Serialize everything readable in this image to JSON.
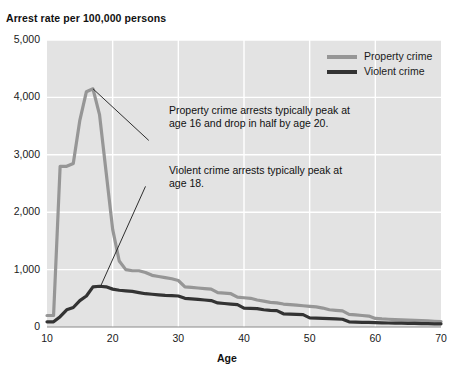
{
  "chart_data": {
    "type": "line",
    "title": "Arrest rate per 100,000 persons",
    "xlabel": "Age",
    "ylabel": "Arrest rate per 100,000 persons",
    "xlim": [
      10,
      70
    ],
    "ylim": [
      0,
      5000
    ],
    "grid": true,
    "legend_position": "top-right",
    "y_ticks": [
      "0",
      "1,000",
      "2,000",
      "3,000",
      "4,000",
      "5,000"
    ],
    "y_tick_values": [
      0,
      1000,
      2000,
      3000,
      4000,
      5000
    ],
    "x_ticks": [
      "10",
      "20",
      "30",
      "40",
      "50",
      "60",
      "70"
    ],
    "x_tick_values": [
      10,
      20,
      30,
      40,
      50,
      60,
      70
    ],
    "x": [
      10,
      11,
      12,
      13,
      14,
      15,
      16,
      17,
      18,
      19,
      20,
      21,
      22,
      23,
      24,
      25,
      26,
      27,
      28,
      29,
      30,
      31,
      32,
      33,
      34,
      35,
      36,
      37,
      38,
      39,
      40,
      41,
      42,
      43,
      44,
      45,
      46,
      47,
      48,
      49,
      50,
      51,
      52,
      53,
      54,
      55,
      56,
      57,
      58,
      59,
      60,
      61,
      62,
      63,
      64,
      65,
      66,
      67,
      68,
      69,
      70
    ],
    "series": [
      {
        "name": "Property crime",
        "color": "#969696",
        "values": [
          200,
          200,
          2800,
          2800,
          2850,
          3600,
          4100,
          4150,
          3700,
          2700,
          1700,
          1150,
          1000,
          980,
          980,
          950,
          900,
          880,
          860,
          840,
          810,
          700,
          690,
          680,
          670,
          660,
          600,
          590,
          580,
          520,
          510,
          500,
          470,
          450,
          430,
          420,
          400,
          390,
          380,
          370,
          360,
          350,
          330,
          300,
          290,
          280,
          220,
          210,
          200,
          190,
          150,
          140,
          135,
          130,
          125,
          120,
          115,
          110,
          105,
          100,
          95
        ]
      },
      {
        "name": "Violent crime",
        "color": "#333333",
        "values": [
          90,
          90,
          180,
          300,
          340,
          460,
          540,
          700,
          710,
          700,
          660,
          640,
          630,
          620,
          600,
          580,
          570,
          560,
          550,
          545,
          540,
          500,
          490,
          480,
          470,
          460,
          420,
          410,
          400,
          390,
          330,
          325,
          320,
          300,
          290,
          285,
          230,
          225,
          220,
          215,
          160,
          155,
          150,
          145,
          140,
          135,
          90,
          85,
          82,
          80,
          75,
          72,
          70,
          68,
          66,
          64,
          62,
          60,
          58,
          56,
          55
        ]
      }
    ],
    "annotations": [
      {
        "id": "property-annotation",
        "text": "Property crime arrests typically peak at\nage 16 and drop in half by age 20.",
        "leader_from_x": 17.0,
        "leader_from_y": 4150,
        "leader_to_x": 25.5,
        "leader_to_y": 3250
      },
      {
        "id": "violent-annotation",
        "text": "Violent crime arrests typically peak at\nage 18.",
        "leader_from_x": 18.2,
        "leader_from_y": 720,
        "leader_to_x": 25.0,
        "leader_to_y": 2450
      }
    ],
    "plot_background": "#e3e3e3",
    "gridline_color": "#ffffff",
    "page_background": "#ffffff"
  }
}
